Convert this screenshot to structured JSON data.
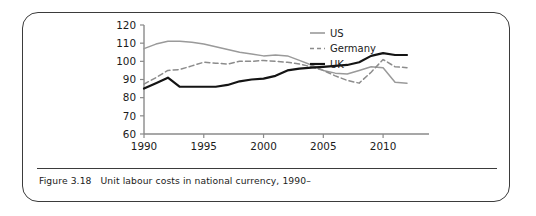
{
  "caption": {
    "label": "Figure 3.18",
    "text": "Unit labour costs in national currency, 1990–"
  },
  "colors": {
    "us": "#9a9a9a",
    "germany": "#8c8c8c",
    "uk": "#141414",
    "axis": "#8a8a8a",
    "frame": "#3b3b3b",
    "text": "#1b1b1b"
  },
  "chart_data": {
    "type": "line",
    "title": "",
    "xlabel": "",
    "ylabel": "",
    "xlim": [
      1990,
      2012
    ],
    "ylim": [
      60,
      120
    ],
    "ytick_labels": [
      "60",
      "70",
      "80",
      "90",
      "100",
      "110",
      "120"
    ],
    "yticks": [
      60,
      70,
      80,
      90,
      100,
      110,
      120
    ],
    "xtick_labels": [
      "1990",
      "1995",
      "2000",
      "2005",
      "2010"
    ],
    "xticks": [
      1990,
      1995,
      2000,
      2005,
      2010
    ],
    "grid": false,
    "legend_position": "top-right",
    "x": [
      1990,
      1991,
      1992,
      1993,
      1994,
      1995,
      1996,
      1997,
      1998,
      1999,
      2000,
      2001,
      2002,
      2003,
      2004,
      2005,
      2006,
      2007,
      2008,
      2009,
      2010,
      2011,
      2012
    ],
    "series": [
      {
        "name": "US",
        "style": "solid",
        "color": "#9a9a9a",
        "values": [
          107,
          109.5,
          111,
          111,
          110.5,
          109.5,
          108,
          106.5,
          105,
          104,
          103,
          103.5,
          103,
          100.5,
          98,
          95,
          93.5,
          93,
          95,
          97,
          96.5,
          88.5,
          88
        ]
      },
      {
        "name": "Germany",
        "style": "dashed",
        "color": "#8c8c8c",
        "values": [
          87.5,
          91,
          95,
          95.5,
          97.5,
          99.5,
          99,
          98.5,
          100,
          100,
          100.5,
          100,
          99.5,
          98.5,
          97,
          95,
          92,
          89.5,
          88,
          94,
          101,
          97,
          96.5
        ]
      },
      {
        "name": "UK",
        "style": "solid",
        "color": "#141414",
        "values": [
          85,
          88,
          91,
          86,
          86,
          86,
          86,
          87,
          89,
          90,
          90.5,
          92,
          95,
          96,
          96.5,
          97,
          97.5,
          98,
          99.5,
          103,
          104.5,
          103.5,
          103.5
        ]
      }
    ]
  },
  "legend": {
    "items": [
      {
        "label": "US",
        "style": "solid",
        "color": "#9a9a9a"
      },
      {
        "label": "Germany",
        "style": "dashed",
        "color": "#8c8c8c"
      },
      {
        "label": "UK",
        "style": "solid",
        "color": "#141414"
      }
    ]
  }
}
